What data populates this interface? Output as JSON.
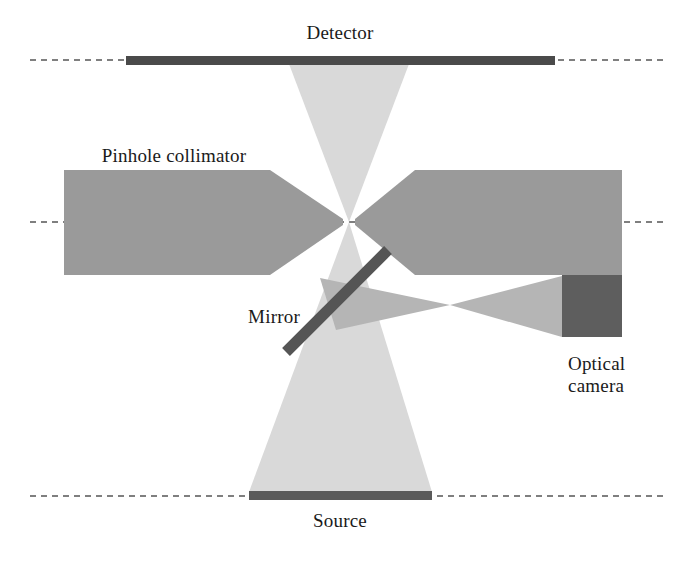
{
  "figure": {
    "kind": "optical-schematic",
    "width": 693,
    "height": 568,
    "background": "#ffffff"
  },
  "palette": {
    "background": "#ffffff",
    "collimator_gray": "#9a9a9a",
    "detector_dark": "#4a4a4a",
    "source_dark": "#5a5a5a",
    "mirror_dark": "#555555",
    "camera_dark": "#5e5e5e",
    "gamma_beam_light": "#d9d9d9",
    "optical_beam_gray": "#b5b5b5",
    "axis_line": "#555555",
    "text": "#1a1a1a"
  },
  "labels": {
    "detector": "Detector",
    "pinhole_collimator": "Pinhole collimator",
    "mirror": "Mirror",
    "source": "Source",
    "optical_camera_line1": "Optical",
    "optical_camera_line2": "camera"
  },
  "geometry": {
    "pinhole": {
      "x": 349,
      "y": 222
    },
    "detector_bar": {
      "x1": 126,
      "y1": 56,
      "x2": 555,
      "y2": 65
    },
    "source_bar": {
      "x1": 249,
      "y1": 491,
      "x2": 432,
      "y2": 500
    },
    "camera_block": {
      "x1": 562,
      "y1": 275,
      "x2": 622,
      "y2": 337
    },
    "mirror_bar": {
      "x1": 286,
      "y1": 352,
      "x2": 388,
      "y2": 250,
      "thickness": 11
    },
    "optical_waist": {
      "x": 450,
      "y": 305
    },
    "axis_lines_y": [
      60,
      222,
      496
    ],
    "collimator_left": {
      "x_start": 64,
      "x_rect_end": 270,
      "y_top": 170,
      "y_bottom": 275
    },
    "collimator_right": {
      "x_end": 622,
      "x_rect_start": 415,
      "y_top": 170,
      "y_bottom": 275
    },
    "gamma_cone_top": {
      "half_width_at_detector": 60
    },
    "gamma_cone_bottom": {
      "half_width_at_source": 92
    }
  },
  "label_positions": {
    "detector": {
      "x": 340,
      "y": 22
    },
    "pinhole_collimator": {
      "x": 174,
      "y": 145
    },
    "mirror": {
      "x": 274,
      "y": 306
    },
    "source": {
      "x": 340,
      "y": 510
    },
    "optical_camera": {
      "x": 568,
      "y": 364
    }
  }
}
